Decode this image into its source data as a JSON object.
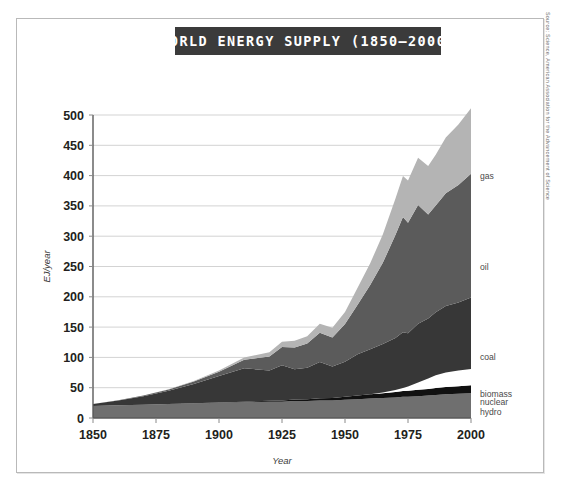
{
  "figure": {
    "title": "WORLD ENERGY SUPPLY (1850–2000)",
    "source_credit": "Source: Science, American Association for the Advancement of Science"
  },
  "chart_data": {
    "type": "area",
    "stacked": true,
    "title": "WORLD ENERGY SUPPLY (1850–2000)",
    "xlabel": "Year",
    "ylabel": "EJ/year",
    "xlim": [
      1850,
      2000
    ],
    "ylim": [
      0,
      500
    ],
    "grid": true,
    "legend_position": "right-inline",
    "xticks": [
      1850,
      1875,
      1900,
      1925,
      1950,
      1975,
      2000
    ],
    "yticks": [
      0,
      50,
      100,
      150,
      200,
      250,
      300,
      350,
      400,
      450,
      500
    ],
    "x": [
      1850,
      1860,
      1870,
      1880,
      1890,
      1900,
      1910,
      1920,
      1925,
      1930,
      1935,
      1940,
      1945,
      1950,
      1955,
      1960,
      1965,
      1970,
      1973,
      1975,
      1979,
      1983,
      1986,
      1990,
      1995,
      2000
    ],
    "series": [
      {
        "name": "biomass",
        "color": "#6f6f6f",
        "label_value": 40,
        "values": [
          20,
          21,
          22,
          23,
          24,
          25,
          26,
          27,
          27,
          28,
          28,
          29,
          29,
          30,
          31,
          32,
          33,
          34,
          35,
          35,
          36,
          37,
          38,
          39,
          40,
          41
        ]
      },
      {
        "name": "hydro",
        "color": "#111111",
        "label_value": 10,
        "values": [
          0,
          0,
          0,
          0,
          0.2,
          0.5,
          1,
          1.5,
          2,
          2.5,
          3,
          3.5,
          4,
          5,
          6,
          7,
          8,
          9,
          9.5,
          10,
          10.5,
          11,
          11.5,
          12,
          12.5,
          13
        ]
      },
      {
        "name": "nuclear",
        "color": "#ffffff",
        "label_value": 26,
        "values": [
          0,
          0,
          0,
          0,
          0,
          0,
          0,
          0,
          0,
          0,
          0,
          0,
          0,
          0,
          0,
          0.3,
          1,
          3,
          5,
          7,
          12,
          17,
          21,
          24,
          26,
          27
        ]
      },
      {
        "name": "coal",
        "color": "#373737",
        "label_value": 100,
        "values": [
          3,
          8,
          14,
          22,
          32,
          44,
          55,
          50,
          58,
          50,
          52,
          60,
          52,
          58,
          68,
          74,
          80,
          86,
          92,
          88,
          97,
          99,
          104,
          110,
          112,
          118
        ]
      },
      {
        "name": "oil",
        "color": "#5b5b5b",
        "label_value": 250,
        "values": [
          0,
          0.3,
          1,
          2,
          4,
          7,
          14,
          23,
          30,
          36,
          40,
          48,
          48,
          62,
          82,
          106,
          134,
          170,
          190,
          182,
          196,
          172,
          176,
          186,
          194,
          204
        ]
      },
      {
        "name": "gas",
        "color": "#b4b4b4",
        "label_value": 400,
        "values": [
          0,
          0,
          0.2,
          0.5,
          1,
          2,
          4,
          7,
          9,
          11,
          12,
          15,
          16,
          20,
          28,
          36,
          47,
          60,
          68,
          70,
          78,
          80,
          84,
          92,
          100,
          108
        ]
      }
    ],
    "total_2000": 511,
    "stack_order": [
      "biomass",
      "hydro",
      "nuclear",
      "coal",
      "oil",
      "gas"
    ]
  }
}
